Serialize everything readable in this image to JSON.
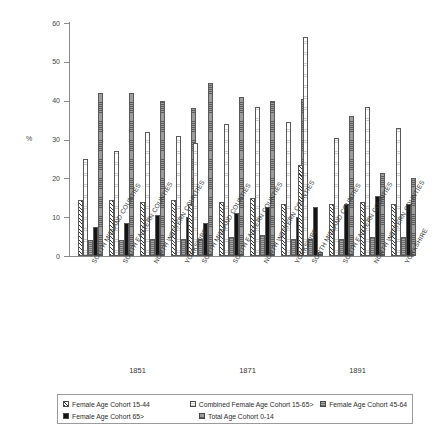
{
  "chart_data": {
    "type": "bar",
    "title": "",
    "xlabel": "",
    "ylabel": "%",
    "ylim": [
      0,
      60
    ],
    "yticks": [
      0,
      10,
      20,
      30,
      40,
      50,
      60
    ],
    "grid": false,
    "legend_position": "bottom",
    "groups": [
      "1851",
      "1871",
      "1891"
    ],
    "categories": [
      "SOUTH MIDLAND COUNTIES",
      "SOUTH EASTERN COUNTIES",
      "NORTH WESTERN COUNTIES",
      "YORKSHIRE"
    ],
    "series": [
      {
        "name": "Female Age Cohort 15-44",
        "key": "s0",
        "values_1851": [
          14.5,
          14.5,
          14.0,
          14.5
        ],
        "values_1871": [
          13.5,
          14.0,
          15.0,
          13.5
        ],
        "values_1891": [
          23.5,
          13.5,
          14.0,
          13.5
        ]
      },
      {
        "name": "Combined Female Age Cohort 15-65>",
        "key": "s1",
        "values_1851": [
          25.0,
          27.0,
          32.0,
          31.0
        ],
        "values_1871": [
          29.0,
          34.0,
          38.5,
          34.5
        ],
        "values_1891": [
          56.5,
          30.5,
          38.5,
          33.0
        ]
      },
      {
        "name": "Female Age Cohort 45-64",
        "key": "s2",
        "values_1851": [
          4.0,
          4.0,
          4.5,
          4.5
        ],
        "values_1871": [
          4.5,
          5.0,
          5.5,
          4.5
        ],
        "values_1891": [
          4.5,
          4.5,
          5.0,
          5.0
        ]
      },
      {
        "name": "Female Age Cohort 65>",
        "key": "s3",
        "values_1851": [
          7.5,
          8.5,
          10.5,
          10.0
        ],
        "values_1871": [
          8.5,
          11.0,
          12.5,
          10.0
        ],
        "values_1891": [
          12.5,
          13.5,
          15.5,
          13.5
        ]
      },
      {
        "name": "Total Age Cohort 0-14",
        "key": "s4",
        "values_1851": [
          42.0,
          42.0,
          40.0,
          38.0
        ],
        "values_1871": [
          44.5,
          41.0,
          40.0,
          40.5
        ],
        "values_1891": [
          1.0,
          36.0,
          21.5,
          20.0
        ]
      }
    ]
  },
  "axis": {
    "y_title": "%",
    "tick_labels": [
      "0",
      "10",
      "20",
      "30",
      "40",
      "50",
      "60"
    ]
  },
  "group_labels": {
    "g0": "1851",
    "g1": "1871",
    "g2": "1891"
  },
  "category_labels": {
    "c0": "SOUTH MIDLAND COUNTIES",
    "c1": "SOUTH EASTERN COUNTIES",
    "c2": "NORTH WESTERN COUNTIES",
    "c3": "YORKSHIRE"
  },
  "legend": {
    "items": [
      {
        "label": "Female Age Cohort 15-44",
        "swatch": "hatch-diagonal-swatch"
      },
      {
        "label": "Combined Female Age Cohort 15-65>",
        "swatch": "light-dotted-swatch"
      },
      {
        "label": "Female Age Cohort 45-64",
        "swatch": "grey-grid-swatch"
      },
      {
        "label": "Female Age Cohort 65>",
        "swatch": "solid-black-swatch"
      },
      {
        "label": "Total Age Cohort 0-14",
        "swatch": "grey-crosshatch-swatch"
      }
    ]
  }
}
